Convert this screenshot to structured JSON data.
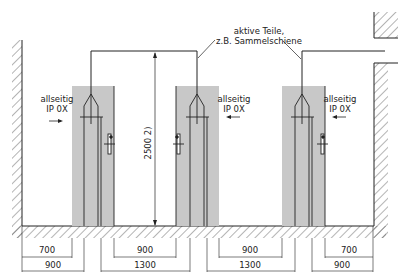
{
  "diagram": {
    "type": "technical-drawing",
    "callout": {
      "line1": "aktive Teile,",
      "line2": "z.B. Sammelschiene"
    },
    "protection_labels": [
      {
        "line1": "allseitig",
        "line2": "IP 0X",
        "arrow": "right"
      },
      {
        "line1": "allseitig",
        "line2": "IP 0X",
        "arrow": "left"
      },
      {
        "line1": "allseitig",
        "line2": "IP 0X",
        "arrow": "left"
      }
    ],
    "height_dimension": "2500 2)",
    "dimensions_row1": [
      "700",
      "900",
      "900",
      "700"
    ],
    "dimensions_row2": [
      "900",
      "1300",
      "1300",
      "900"
    ],
    "colors": {
      "line": "#222222",
      "zone_fill": "#c8c8c8",
      "background": "#ffffff"
    }
  }
}
